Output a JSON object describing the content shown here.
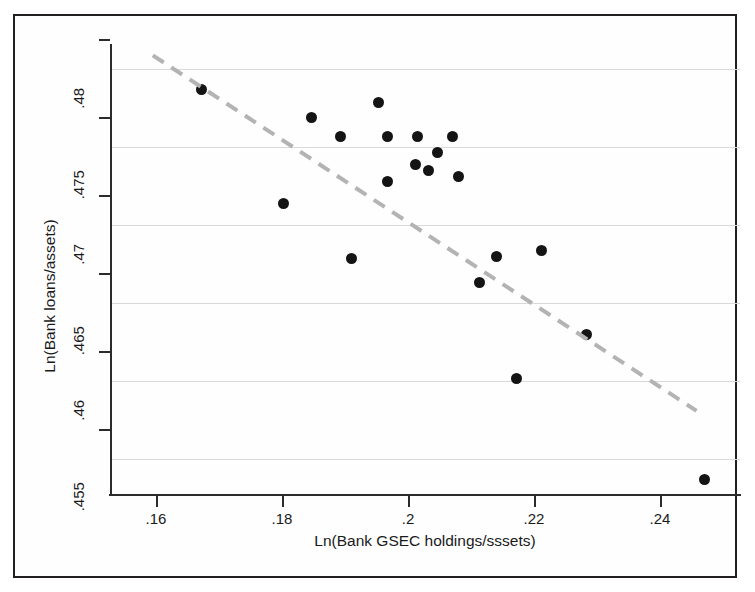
{
  "chart_data": {
    "type": "scatter",
    "title": "",
    "xlabel": "Ln(Bank GSEC holdings/sssets)",
    "ylabel": "Ln(Bank loans/assets)",
    "xlim": [
      0.1527,
      0.2527
    ],
    "ylim": [
      0.4527,
      0.4815
    ],
    "grid": true,
    "grid_axis": "y",
    "legend": null,
    "xticks": [
      0.16,
      0.18,
      0.2,
      0.22,
      0.24
    ],
    "xtick_labels": [
      ".16",
      ".18",
      ".2",
      ".22",
      ".24"
    ],
    "yticks": [
      0.455,
      0.46,
      0.465,
      0.47,
      0.475,
      0.48
    ],
    "ytick_labels": [
      ".455",
      ".46",
      ".465",
      ".47",
      ".475",
      ".48"
    ],
    "marker": {
      "shape": "circle",
      "color": "#141414",
      "size_px": 11
    },
    "points": [
      {
        "x": 0.1673,
        "y": 0.4787
      },
      {
        "x": 0.1847,
        "y": 0.4769
      },
      {
        "x": 0.1893,
        "y": 0.4757
      },
      {
        "x": 0.1803,
        "y": 0.4714
      },
      {
        "x": 0.1911,
        "y": 0.4679
      },
      {
        "x": 0.1953,
        "y": 0.4779
      },
      {
        "x": 0.1967,
        "y": 0.4757
      },
      {
        "x": 0.2015,
        "y": 0.4757
      },
      {
        "x": 0.207,
        "y": 0.4757
      },
      {
        "x": 0.2047,
        "y": 0.4747
      },
      {
        "x": 0.2012,
        "y": 0.4739
      },
      {
        "x": 0.2033,
        "y": 0.4735
      },
      {
        "x": 0.208,
        "y": 0.4731
      },
      {
        "x": 0.1968,
        "y": 0.4728
      },
      {
        "x": 0.2113,
        "y": 0.4663
      },
      {
        "x": 0.2141,
        "y": 0.468
      },
      {
        "x": 0.2212,
        "y": 0.4684
      },
      {
        "x": 0.2172,
        "y": 0.4602
      },
      {
        "x": 0.2283,
        "y": 0.463
      },
      {
        "x": 0.247,
        "y": 0.4537
      }
    ],
    "trend_line": {
      "style": "dashed",
      "color": "#b3b3b3",
      "width_px": 4,
      "x_start": 0.1595,
      "y_start": 0.4809,
      "x_end": 0.2458,
      "y_end": 0.4581
    }
  },
  "axis": {
    "x_title": "Ln(Bank GSEC holdings/sssets)",
    "y_title": "Ln(Bank loans/assets)"
  }
}
